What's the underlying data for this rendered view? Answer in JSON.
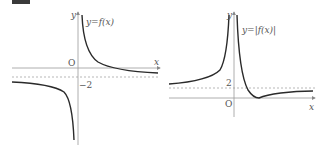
{
  "badge": {
    "label": ""
  },
  "graphs": [
    {
      "id": "left",
      "curve_label": "y=f(x)",
      "x_axis_label": "x",
      "y_axis_label": "y",
      "origin_label": "O",
      "asymptote_label": "−2",
      "asymptote_value": -2
    },
    {
      "id": "right",
      "curve_label": "y=|f(x)|",
      "x_axis_label": "x",
      "y_axis_label": "y",
      "origin_label": "O",
      "asymptote_label": "2",
      "asymptote_value": 2
    }
  ],
  "colors": {
    "curve": "#2a2a2a",
    "axis": "#888888",
    "dashed": "#999999",
    "text": "#555555"
  }
}
